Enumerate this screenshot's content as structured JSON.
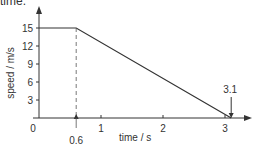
{
  "caption_fragment": "time.",
  "chart_data": {
    "type": "line",
    "title": "",
    "xlabel": "time / s",
    "ylabel": "speed / m/s",
    "x": [
      0,
      0.6,
      3.1
    ],
    "series": [
      {
        "name": "speed",
        "values": [
          15,
          15,
          0
        ]
      }
    ],
    "xlim": [
      0,
      3.5
    ],
    "ylim": [
      0,
      17
    ],
    "x_ticks": [
      1,
      2,
      3
    ],
    "x_tick_labels": [
      "1",
      "2",
      "3"
    ],
    "y_ticks": [
      3,
      6,
      9,
      12,
      15
    ],
    "y_tick_labels": [
      "3",
      "6",
      "9",
      "12",
      "15"
    ],
    "origin_label": "0",
    "annotations": [
      {
        "text": "0.6",
        "x": 0.6,
        "kind": "dashed-vertical-with-arrow"
      },
      {
        "text": "3.1",
        "x": 3.1,
        "kind": "down-arrow"
      }
    ],
    "grid": false,
    "line_color": "#333333"
  }
}
